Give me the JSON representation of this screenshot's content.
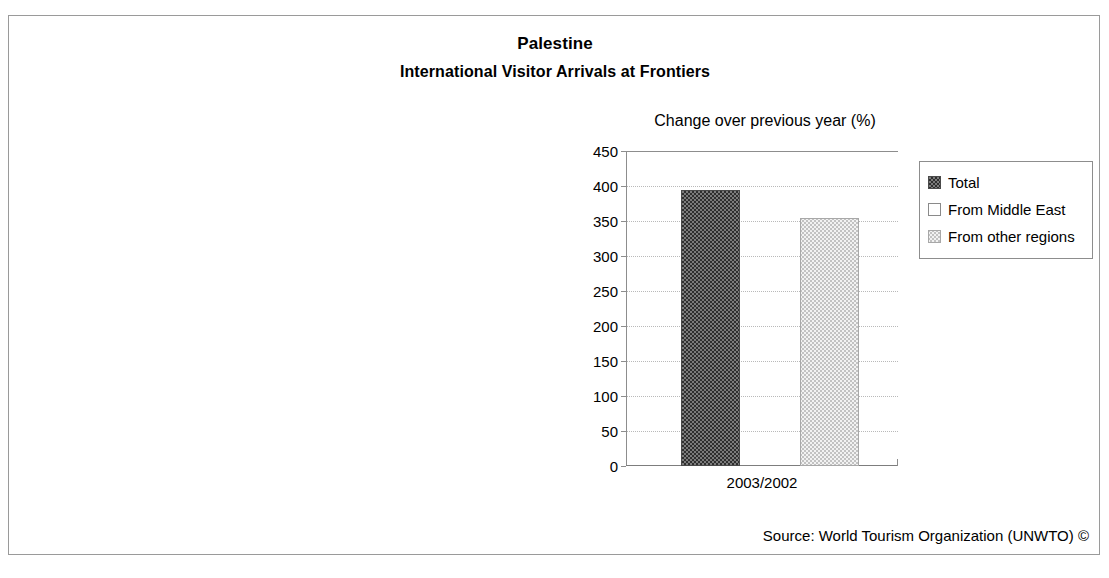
{
  "figure": {
    "main_title": "Palestine",
    "sub_title": "International Visitor Arrivals at Frontiers",
    "axis_note": "Change over previous year (%)",
    "source": "Source: World Tourism Organization (UNWTO) ©",
    "border_color": "#9a9a9a",
    "background": "#ffffff"
  },
  "chart_data": {
    "type": "bar",
    "subtitle": "Change over previous year (%)",
    "xlabel": "",
    "ylabel": "Change over previous year (%)",
    "categories": [
      "2003/2002"
    ],
    "series": [
      {
        "name": "Total",
        "values": [
          394
        ],
        "pattern": "dark-checker",
        "color": "#5c5c5c"
      },
      {
        "name": "From Middle East",
        "values": [
          0
        ],
        "pattern": "white",
        "color": "#ffffff"
      },
      {
        "name": "From other regions",
        "values": [
          355
        ],
        "pattern": "light-dot",
        "color": "#ebebeb"
      }
    ],
    "ylim": [
      0,
      450
    ],
    "ytick_step": 50,
    "yticks": [
      450,
      400,
      350,
      300,
      250,
      200,
      150,
      100,
      50,
      0
    ],
    "ytick_labels": [
      "450",
      "400",
      "350",
      "300",
      "250",
      "200",
      "150",
      "100",
      "50",
      "0"
    ],
    "grid": true,
    "grid_style": "dotted-horizontal",
    "legend_position": "right"
  },
  "legend": {
    "items": [
      {
        "label": "Total",
        "pattern": "dark-checker"
      },
      {
        "label": "From Middle East",
        "pattern": "white"
      },
      {
        "label": "From other regions",
        "pattern": "light-dot"
      }
    ]
  }
}
